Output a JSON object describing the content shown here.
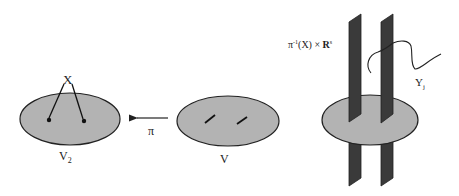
{
  "diagram": {
    "colors": {
      "ellipse_fill": "#b3b3b3",
      "stroke": "#222222",
      "plane_fill": "#3a3a3a",
      "background": "#ffffff"
    },
    "labels": {
      "x": "X",
      "v2": "V",
      "v2_sub": "2",
      "pi": "π",
      "v": "V",
      "fiber_pi": "π",
      "fiber_sup": "-1",
      "fiber_mid": "(X) × ",
      "fiber_R": "R",
      "fiber_Rsup": "s",
      "y": "Y",
      "y_sub": "j"
    },
    "nodes": [
      {
        "id": "V2",
        "label": "V2",
        "shape": "ellipse",
        "contents": "two points labeled X"
      },
      {
        "id": "V",
        "label": "V",
        "shape": "ellipse",
        "contents": "two short segments"
      },
      {
        "id": "fiber",
        "label": "π^-1(X) × R^s",
        "shape": "ellipse with two vertical planes",
        "contents": "curve Y_j"
      }
    ],
    "edges": [
      {
        "from": "V",
        "to": "V2",
        "label": "π"
      }
    ]
  }
}
